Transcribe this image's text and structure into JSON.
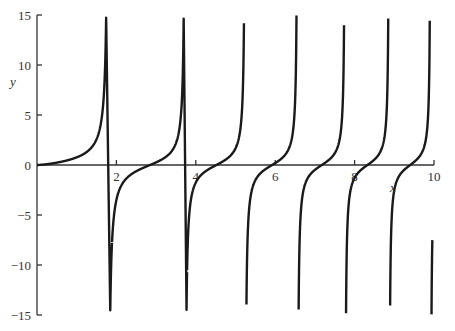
{
  "chart_data": {
    "type": "line",
    "title": "",
    "xlabel": "x",
    "ylabel": "y",
    "xlim": [
      0,
      10
    ],
    "ylim": [
      -15,
      15
    ],
    "grid": false,
    "legend": null,
    "x_ticks": [
      2,
      4,
      6,
      8,
      10
    ],
    "x_tick_labels": [
      "2",
      "4",
      "6",
      "8",
      "10"
    ],
    "y_ticks": [
      15,
      10,
      5,
      0,
      -5,
      -10,
      -15
    ],
    "y_tick_labels": [
      "15",
      "10",
      "5",
      "0",
      "−5",
      "−10",
      "−15"
    ],
    "function_estimate": "y = tan(0.654 * x^1.5)",
    "asymptotes_x": [
      1.89,
      3.78,
      5.24,
      6.57,
      7.76,
      8.87,
      9.92
    ],
    "zeros_x": [
      0,
      3.02,
      4.63,
      5.95,
      7.25,
      8.39,
      9.47
    ],
    "branches": [
      {
        "x_start": 0.0,
        "x_end": 1.89,
        "y_start": 0,
        "y_end": 15
      },
      {
        "x_start": 2.0,
        "x_end": 3.78,
        "y_start": -15,
        "y_end": 15
      },
      {
        "x_start": 3.96,
        "x_end": 5.24,
        "y_start": -15,
        "y_end": 15
      },
      {
        "x_start": 5.38,
        "x_end": 6.57,
        "y_start": -15,
        "y_end": 15
      },
      {
        "x_start": 6.69,
        "x_end": 7.76,
        "y_start": -15,
        "y_end": 15
      },
      {
        "x_start": 7.86,
        "x_end": 8.87,
        "y_start": -15,
        "y_end": 15
      },
      {
        "x_start": 8.96,
        "x_end": 9.92,
        "y_start": -15,
        "y_end": 15
      },
      {
        "x_start": 10.0,
        "x_end": 10.03,
        "y_start": -15,
        "y_end": -7.5
      }
    ],
    "sample_points": [
      {
        "x": 0.5,
        "y": 0.24
      },
      {
        "x": 1.0,
        "y": 0.77
      },
      {
        "x": 1.5,
        "y": 1.8
      },
      {
        "x": 1.8,
        "y": 6.0
      },
      {
        "x": 3.02,
        "y": 0
      },
      {
        "x": 4.63,
        "y": 0
      },
      {
        "x": 5.95,
        "y": 0
      },
      {
        "x": 7.25,
        "y": 0
      },
      {
        "x": 8.39,
        "y": 0
      },
      {
        "x": 9.47,
        "y": 0
      },
      {
        "x": 10.0,
        "y": -7.5
      }
    ]
  },
  "colors": {
    "ink": "#1a1a1a",
    "axis": "#333333",
    "background": "#ffffff"
  }
}
